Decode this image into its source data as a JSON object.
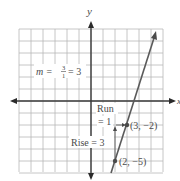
{
  "chart_data": {
    "type": "line",
    "title": "",
    "xlabel": "x",
    "ylabel": "y",
    "xlim": [
      -6,
      6
    ],
    "ylim": [
      -6,
      6
    ],
    "grid": true,
    "series": [
      {
        "name": "line with slope 3",
        "points": [
          [
            1.7,
            -6
          ],
          [
            5.3,
            5
          ]
        ],
        "slope": 3
      }
    ],
    "points": [
      {
        "label": "(3, −2)",
        "x": 3,
        "y": -2
      },
      {
        "label": "(2, −5)",
        "x": 2,
        "y": -5
      }
    ],
    "annotations": {
      "slope": {
        "lhs": "m =",
        "num": "3",
        "den": "1",
        "rhs": "= 3"
      },
      "run": {
        "line1": "Run",
        "line2": "= 1"
      },
      "rise": "Rise = 3"
    }
  },
  "colors": {
    "grid": "#b8b8b8",
    "axis": "#3a3a3a",
    "line": "#5a5a5a",
    "text": "#4a4a4a"
  }
}
